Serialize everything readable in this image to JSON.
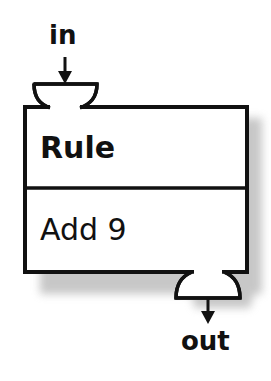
{
  "diagram": {
    "input_label": "in",
    "output_label": "out",
    "box": {
      "title": "Rule",
      "rule": "Add 9"
    },
    "colors": {
      "stroke": "#111111",
      "fill": "#ffffff",
      "shadow": "#b5b5b5"
    }
  }
}
